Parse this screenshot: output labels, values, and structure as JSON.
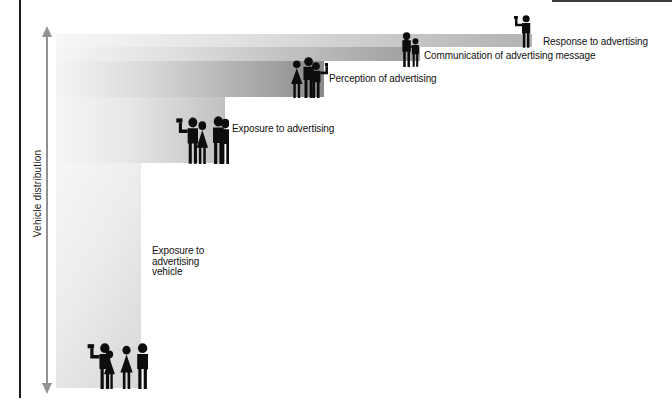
{
  "figure": {
    "axis_label": "Vehicle distribution",
    "stages": [
      {
        "id": "response",
        "label": "Response to advertising",
        "people_count": 1,
        "icon": "person-raising-flag-icon",
        "bar_end_color": "#b2b2b2"
      },
      {
        "id": "communication",
        "label": "Communication of advertising message",
        "people_count": 2,
        "icon": "people-group-2-icon",
        "bar_end_color": "#9d9d9d"
      },
      {
        "id": "perception",
        "label": "Perception of advertising",
        "people_count": 3,
        "icon": "people-group-3-icon",
        "bar_end_color": "#8a8a8a"
      },
      {
        "id": "exposure",
        "label": "Exposure to advertising",
        "people_count": 4,
        "icon": "people-group-4-icon",
        "bar_end_color": "#c0c0c0"
      },
      {
        "id": "vehicle",
        "label_lines": [
          "Exposure to",
          "advertising",
          "vehicle"
        ],
        "people_count": 5,
        "icon": "people-group-5-icon",
        "bar_end_color": "#d6d6d6"
      }
    ],
    "colors": {
      "bar_gradient_start": "#f6f6f6",
      "axis_arrow": "#929292",
      "silhouette": "#0d0d0d",
      "background": "#ffffff"
    }
  }
}
